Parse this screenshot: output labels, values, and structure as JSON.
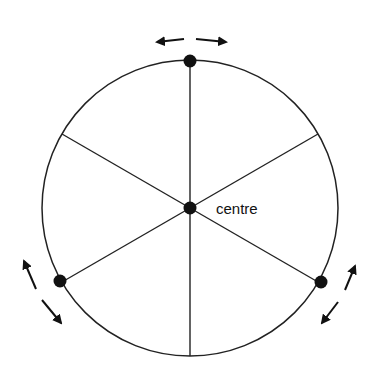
{
  "diagram": {
    "center_label": "centre",
    "colors": {
      "line": "#222222",
      "dot": "#111111",
      "background": "#ffffff"
    },
    "circle": {
      "cx": 190,
      "cy": 208,
      "r": 148
    },
    "spokes": 6,
    "rim_points": [
      {
        "name": "top",
        "angle_deg": -90,
        "has_dot": true,
        "arrow": "tangential-double"
      },
      {
        "name": "lower-left",
        "angle_deg": 150,
        "has_dot": true,
        "arrow": "tangential-double"
      },
      {
        "name": "lower-right",
        "angle_deg": 30,
        "has_dot": true,
        "arrow": "tangential-double"
      }
    ]
  }
}
